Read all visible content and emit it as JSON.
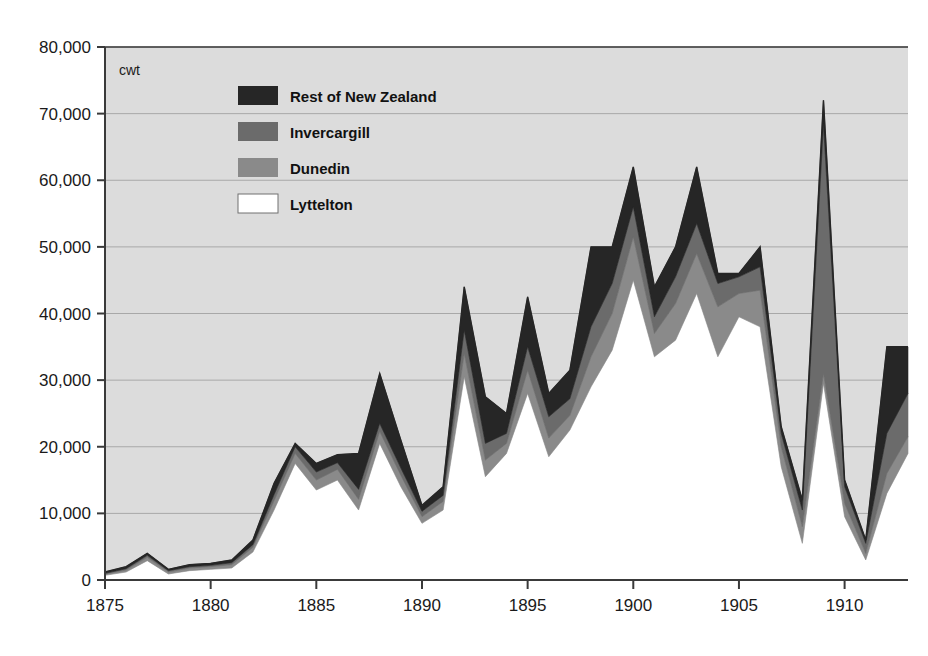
{
  "chart_data": {
    "type": "area",
    "stacked": true,
    "title": "",
    "subtitle": "",
    "xlabel": "",
    "ylabel": "",
    "unit_label": "cwt",
    "xlim": [
      1875,
      1913
    ],
    "ylim": [
      0,
      80000
    ],
    "grid": true,
    "legend_position": "top-left-inside",
    "y_ticks": [
      0,
      10000,
      20000,
      30000,
      40000,
      50000,
      60000,
      70000,
      80000
    ],
    "y_tick_labels": [
      "0",
      "10,000",
      "20,000",
      "30,000",
      "40,000",
      "50,000",
      "60,000",
      "70,000",
      "80,000"
    ],
    "x_ticks": [
      1875,
      1880,
      1885,
      1890,
      1895,
      1900,
      1905,
      1910
    ],
    "x_tick_labels": [
      "1875",
      "1880",
      "1885",
      "1890",
      "1895",
      "1900",
      "1905",
      "1910"
    ],
    "x": [
      1875,
      1876,
      1877,
      1878,
      1879,
      1880,
      1881,
      1882,
      1883,
      1884,
      1885,
      1886,
      1887,
      1888,
      1889,
      1890,
      1891,
      1892,
      1893,
      1894,
      1895,
      1896,
      1897,
      1898,
      1899,
      1900,
      1901,
      1902,
      1903,
      1904,
      1905,
      1906,
      1907,
      1908,
      1909,
      1910,
      1911,
      1912,
      1913
    ],
    "series": [
      {
        "name": "Lyttelton",
        "color": "#ffffff",
        "values": [
          700,
          1200,
          2900,
          900,
          1400,
          1600,
          1800,
          4200,
          10500,
          17500,
          13500,
          15000,
          10500,
          20500,
          14000,
          8500,
          10500,
          30500,
          15500,
          19000,
          28000,
          18500,
          22500,
          29000,
          34500,
          45000,
          33500,
          36000,
          43000,
          33500,
          39500,
          38000,
          17000,
          5500,
          29500,
          9500,
          3000,
          13000,
          19000
        ]
      },
      {
        "name": "Dunedin",
        "color": "#8a8a8a",
        "values": [
          200,
          300,
          500,
          300,
          400,
          400,
          500,
          700,
          1400,
          1500,
          1500,
          1600,
          1600,
          1800,
          1700,
          1000,
          1300,
          3500,
          2500,
          1500,
          3500,
          2800,
          2200,
          4500,
          5500,
          6500,
          3500,
          5500,
          6000,
          7500,
          3500,
          5500,
          3000,
          2500,
          1500,
          2000,
          1000,
          3000,
          2500
        ]
      },
      {
        "name": "Invercargill",
        "color": "#6b6b6b",
        "values": [
          100,
          200,
          300,
          200,
          200,
          200,
          300,
          400,
          900,
          1000,
          1200,
          1000,
          1500,
          1200,
          1100,
          800,
          900,
          3500,
          2500,
          1500,
          3500,
          3200,
          2500,
          4500,
          4500,
          4500,
          2500,
          4000,
          4500,
          3500,
          2500,
          3500,
          2000,
          2500,
          37500,
          2500,
          1500,
          6000,
          6500
        ]
      },
      {
        "name": "Rest of New Zealand",
        "color": "#262626",
        "values": [
          200,
          300,
          300,
          200,
          300,
          300,
          400,
          700,
          1700,
          500,
          1300,
          1200,
          5400,
          7500,
          4200,
          900,
          1300,
          6500,
          7000,
          3000,
          7500,
          3500,
          4300,
          12000,
          5500,
          6000,
          4500,
          4500,
          8500,
          1500,
          500,
          3000,
          1000,
          1500,
          3500,
          1000,
          500,
          13000,
          7000
        ]
      }
    ]
  },
  "legend": {
    "items": [
      {
        "label": "Rest of New Zealand",
        "color": "#262626"
      },
      {
        "label": "Invercargill",
        "color": "#6b6b6b"
      },
      {
        "label": "Dunedin",
        "color": "#8a8a8a"
      },
      {
        "label": "Lyttelton",
        "color": "#ffffff"
      }
    ]
  },
  "colors": {
    "plot_background": "#dcdcdc",
    "page_background": "#ffffff",
    "axis": "#3a3a3a",
    "gridline": "#a8a8a8",
    "text": "#1a1a1a"
  }
}
